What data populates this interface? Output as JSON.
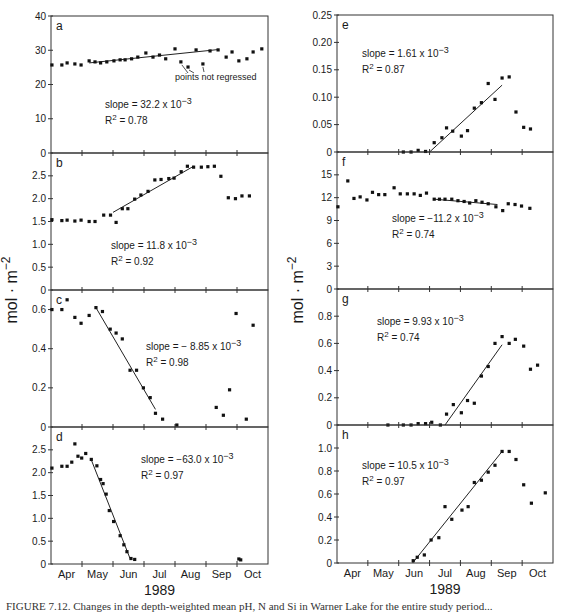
{
  "figure": {
    "ylabel": "mol · m",
    "ylabel_sup": "−2",
    "xlabel": "1989",
    "months": [
      "Apr",
      "May",
      "Jun",
      "Jul",
      "Aug",
      "Sep",
      "Oct"
    ],
    "caption": "FIGURE 7.12. Changes in the depth-weighted mean pH, N and Si in Warner Lake for the entire study period..."
  },
  "chart_data": [
    {
      "type": "scatter",
      "panel": "a",
      "column": "left",
      "ylim": [
        0,
        40
      ],
      "yticks": [
        0,
        10,
        20,
        30,
        40
      ],
      "x_units": "months since start of April (0=Apr 1 ... 7=Oct 31)",
      "points": [
        [
          0.03,
          25.7
        ],
        [
          0.35,
          25.7
        ],
        [
          0.52,
          26.3
        ],
        [
          0.77,
          26.0
        ],
        [
          0.97,
          25.7
        ],
        [
          1.23,
          26.9
        ],
        [
          1.42,
          26.6
        ],
        [
          1.6,
          26.3
        ],
        [
          1.8,
          26.6
        ],
        [
          2.03,
          26.9
        ],
        [
          2.23,
          27.2
        ],
        [
          2.39,
          27.2
        ],
        [
          2.6,
          27.5
        ],
        [
          2.8,
          28.0
        ],
        [
          3.06,
          29.2
        ],
        [
          3.29,
          28.0
        ],
        [
          3.5,
          28.6
        ],
        [
          3.7,
          27.5
        ],
        [
          4.0,
          30.4
        ],
        [
          4.68,
          30.1
        ],
        [
          5.13,
          29.8
        ],
        [
          5.39,
          30.1
        ],
        [
          5.65,
          28.0
        ],
        [
          5.84,
          29.5
        ],
        [
          6.06,
          26.9
        ],
        [
          6.32,
          27.5
        ],
        [
          6.52,
          29.5
        ],
        [
          6.8,
          30.4
        ]
      ],
      "points_not_regressed": [
        [
          4.19,
          26.6
        ],
        [
          4.42,
          25.1
        ],
        [
          4.9,
          26.0
        ]
      ],
      "fit_line": [
        [
          1.23,
          26.3
        ],
        [
          5.39,
          30.2
        ]
      ],
      "annotation": "points not regressed",
      "slope": "slope = 32.2 x 10",
      "slope_exp": "−3",
      "r2": "= 0.78"
    },
    {
      "type": "scatter",
      "panel": "b",
      "column": "left",
      "ylim": [
        0,
        3.0
      ],
      "yticks": [
        0,
        0.5,
        1.0,
        1.5,
        2.0,
        2.5
      ],
      "points": [
        [
          0.03,
          1.54
        ],
        [
          0.35,
          1.52
        ],
        [
          0.52,
          1.53
        ],
        [
          0.77,
          1.51
        ],
        [
          0.97,
          1.53
        ],
        [
          1.23,
          1.5
        ],
        [
          1.42,
          1.5
        ],
        [
          1.7,
          1.64
        ],
        [
          1.92,
          1.64
        ],
        [
          2.1,
          1.48
        ],
        [
          2.3,
          1.78
        ],
        [
          2.48,
          1.78
        ],
        [
          2.7,
          1.99
        ],
        [
          2.9,
          2.08
        ],
        [
          3.13,
          2.16
        ],
        [
          3.35,
          2.41
        ],
        [
          3.55,
          2.42
        ],
        [
          3.8,
          2.44
        ],
        [
          3.97,
          2.45
        ],
        [
          4.2,
          2.59
        ],
        [
          4.4,
          2.71
        ],
        [
          4.6,
          2.69
        ],
        [
          4.85,
          2.69
        ],
        [
          5.06,
          2.7
        ],
        [
          5.27,
          2.71
        ],
        [
          5.48,
          2.49
        ],
        [
          5.72,
          2.02
        ],
        [
          5.95,
          2.0
        ],
        [
          6.16,
          2.06
        ],
        [
          6.4,
          2.06
        ]
      ],
      "fit_line": [
        [
          2.0,
          1.7
        ],
        [
          4.6,
          2.71
        ]
      ],
      "slope": "slope = 11.8 x 10",
      "slope_exp": "−3",
      "r2": "= 0.92"
    },
    {
      "type": "scatter",
      "panel": "c",
      "column": "left",
      "ylim": [
        0,
        0.7
      ],
      "yticks": [
        0,
        0.2,
        0.4,
        0.6
      ],
      "points": [
        [
          0.03,
          0.6
        ],
        [
          0.35,
          0.6
        ],
        [
          0.52,
          0.65
        ],
        [
          0.77,
          0.56
        ],
        [
          0.97,
          0.53
        ],
        [
          1.23,
          0.57
        ],
        [
          1.45,
          0.61
        ],
        [
          1.66,
          0.59
        ],
        [
          1.91,
          0.5
        ],
        [
          2.1,
          0.48
        ],
        [
          2.3,
          0.45
        ],
        [
          2.55,
          0.29
        ],
        [
          2.76,
          0.29
        ],
        [
          2.98,
          0.2
        ],
        [
          3.2,
          0.15
        ],
        [
          3.37,
          0.07
        ],
        [
          3.6,
          0.04
        ],
        [
          4.06,
          0.01
        ],
        [
          5.33,
          0.1
        ],
        [
          5.56,
          0.06
        ],
        [
          5.76,
          0.19
        ],
        [
          5.97,
          0.58
        ],
        [
          6.3,
          0.04
        ],
        [
          6.52,
          0.52
        ]
      ],
      "fit_line": [
        [
          1.45,
          0.61
        ],
        [
          3.37,
          0.09
        ]
      ],
      "slope": "slope  = − 8.85 x 10",
      "slope_exp": "−3",
      "r2": "= 0.98"
    },
    {
      "type": "scatter",
      "panel": "d",
      "column": "left",
      "ylim": [
        0,
        3.0
      ],
      "yticks": [
        0,
        0.5,
        1.0,
        1.5,
        2.0,
        2.5
      ],
      "points": [
        [
          0.03,
          2.1
        ],
        [
          0.35,
          2.14
        ],
        [
          0.52,
          2.14
        ],
        [
          0.67,
          2.23
        ],
        [
          0.77,
          2.63
        ],
        [
          0.87,
          2.36
        ],
        [
          0.99,
          2.32
        ],
        [
          1.12,
          2.42
        ],
        [
          1.3,
          2.29
        ],
        [
          1.48,
          2.15
        ],
        [
          1.6,
          1.85
        ],
        [
          1.68,
          1.76
        ],
        [
          1.78,
          1.53
        ],
        [
          1.88,
          1.17
        ],
        [
          2.02,
          0.93
        ],
        [
          2.23,
          0.62
        ],
        [
          2.35,
          0.42
        ],
        [
          2.45,
          0.27
        ],
        [
          2.58,
          0.12
        ],
        [
          2.7,
          0.1
        ],
        [
          6.06,
          0.11
        ],
        [
          6.12,
          0.09
        ]
      ],
      "fit_line": [
        [
          1.3,
          2.28
        ],
        [
          2.55,
          0.12
        ]
      ],
      "slope": "slope = −63.0 x 10",
      "slope_exp": "−3",
      "r2": "= 0.97"
    },
    {
      "type": "scatter",
      "panel": "e",
      "column": "right",
      "ylim": [
        0,
        0.25
      ],
      "yticks": [
        0,
        0.05,
        0.1,
        0.15,
        0.2,
        0.25
      ],
      "points": [
        [
          2.15,
          0.0
        ],
        [
          2.4,
          0.0
        ],
        [
          2.63,
          0.003
        ],
        [
          2.87,
          0.001
        ],
        [
          3.15,
          0.017
        ],
        [
          3.4,
          0.026
        ],
        [
          3.55,
          0.044
        ],
        [
          3.75,
          0.038
        ],
        [
          4.03,
          0.029
        ],
        [
          4.23,
          0.039
        ],
        [
          4.45,
          0.08
        ],
        [
          4.68,
          0.09
        ],
        [
          4.9,
          0.125
        ],
        [
          5.12,
          0.096
        ],
        [
          5.35,
          0.135
        ],
        [
          5.58,
          0.137
        ],
        [
          5.8,
          0.073
        ],
        [
          6.05,
          0.045
        ],
        [
          6.27,
          0.042
        ]
      ],
      "fit_line": [
        [
          3.0,
          0.0
        ],
        [
          5.35,
          0.122
        ]
      ],
      "slope": "slope = 1.61 x 10",
      "slope_exp": "−3",
      "r2": "= 0.87"
    },
    {
      "type": "scatter",
      "panel": "f",
      "column": "right",
      "ylim": [
        0,
        18
      ],
      "yticks": [
        0,
        3,
        6,
        9,
        12,
        15
      ],
      "points": [
        [
          0.03,
          10.8
        ],
        [
          0.35,
          14.2
        ],
        [
          0.55,
          11.9
        ],
        [
          0.75,
          12.1
        ],
        [
          0.97,
          11.7
        ],
        [
          1.15,
          12.7
        ],
        [
          1.35,
          12.4
        ],
        [
          1.55,
          12.4
        ],
        [
          1.85,
          13.3
        ],
        [
          2.05,
          12.5
        ],
        [
          2.28,
          12.5
        ],
        [
          2.5,
          12.5
        ],
        [
          2.7,
          12.3
        ],
        [
          2.9,
          12.6
        ],
        [
          3.15,
          11.8
        ],
        [
          3.32,
          11.8
        ],
        [
          3.5,
          11.8
        ],
        [
          3.72,
          11.8
        ],
        [
          3.92,
          11.6
        ],
        [
          4.12,
          11.5
        ],
        [
          4.3,
          11.3
        ],
        [
          4.5,
          11.6
        ],
        [
          4.7,
          11.4
        ],
        [
          4.9,
          11.2
        ],
        [
          5.15,
          10.8
        ],
        [
          5.37,
          10.3
        ],
        [
          5.55,
          11.2
        ],
        [
          5.77,
          11.1
        ],
        [
          5.98,
          10.9
        ],
        [
          6.25,
          10.6
        ]
      ],
      "fit_line": [
        [
          3.15,
          11.8
        ],
        [
          5.2,
          11.1
        ]
      ],
      "slope": "slope = −11.2 x 10",
      "slope_exp": "−3",
      "r2": "= 0.74"
    },
    {
      "type": "scatter",
      "panel": "g",
      "column": "right",
      "ylim": [
        0,
        1.0
      ],
      "yticks": [
        0,
        0.2,
        0.4,
        0.6,
        0.8
      ],
      "points": [
        [
          1.65,
          0.0
        ],
        [
          2.15,
          0.0
        ],
        [
          2.4,
          0.0
        ],
        [
          2.63,
          0.01
        ],
        [
          2.87,
          0.01
        ],
        [
          3.07,
          0.02
        ],
        [
          3.35,
          0.0
        ],
        [
          3.55,
          0.08
        ],
        [
          3.77,
          0.15
        ],
        [
          4.03,
          0.09
        ],
        [
          4.23,
          0.18
        ],
        [
          4.45,
          0.16
        ],
        [
          4.68,
          0.36
        ],
        [
          4.9,
          0.43
        ],
        [
          5.12,
          0.6
        ],
        [
          5.35,
          0.65
        ],
        [
          5.58,
          0.6
        ],
        [
          5.78,
          0.63
        ],
        [
          6.05,
          0.58
        ],
        [
          6.27,
          0.41
        ],
        [
          6.5,
          0.44
        ]
      ],
      "fit_line": [
        [
          3.5,
          0.0
        ],
        [
          5.35,
          0.59
        ]
      ],
      "slope": "slope = 9.93 x 10",
      "slope_exp": "−3",
      "r2": "= 0.74"
    },
    {
      "type": "scatter",
      "panel": "h",
      "column": "right",
      "ylim": [
        0,
        1.2
      ],
      "yticks": [
        0,
        0.2,
        0.4,
        0.6,
        0.8,
        1.0
      ],
      "points": [
        [
          2.47,
          0.02
        ],
        [
          2.6,
          0.05
        ],
        [
          2.83,
          0.07
        ],
        [
          3.05,
          0.2
        ],
        [
          3.3,
          0.22
        ],
        [
          3.5,
          0.49
        ],
        [
          3.72,
          0.38
        ],
        [
          4.05,
          0.46
        ],
        [
          4.25,
          0.49
        ],
        [
          4.45,
          0.7
        ],
        [
          4.68,
          0.72
        ],
        [
          4.9,
          0.79
        ],
        [
          5.12,
          0.85
        ],
        [
          5.35,
          0.97
        ],
        [
          5.58,
          0.97
        ],
        [
          5.8,
          0.9
        ],
        [
          6.05,
          0.68
        ],
        [
          6.3,
          0.52
        ],
        [
          6.75,
          0.61
        ]
      ],
      "fit_line": [
        [
          2.45,
          0.0
        ],
        [
          5.35,
          0.97
        ]
      ],
      "slope": "slope = 10.5 x 10",
      "slope_exp": "−3",
      "r2": "= 0.97"
    }
  ]
}
